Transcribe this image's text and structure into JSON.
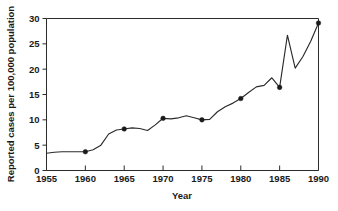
{
  "chart_data": {
    "type": "line",
    "title": "",
    "xlabel": "Year",
    "ylabel": "Reported cases per 100,000 population",
    "xlim": [
      1955,
      1990
    ],
    "ylim": [
      0,
      30
    ],
    "xticks": [
      1955,
      1960,
      1965,
      1970,
      1975,
      1980,
      1985,
      1990
    ],
    "xtick_labels": [
      "1955",
      "1960",
      "1965",
      "1970",
      "1975",
      "1980",
      "1985",
      "1990"
    ],
    "yticks": [
      0,
      5,
      10,
      15,
      20,
      25,
      30
    ],
    "ytick_labels": [
      "0",
      "5",
      "10",
      "15",
      "20",
      "25",
      "30"
    ],
    "grid": false,
    "legend": false,
    "legend_position": "none",
    "marker_style": "filled-circle",
    "marker_years": [
      1960,
      1965,
      1970,
      1975,
      1980,
      1985,
      1990
    ],
    "x": [
      1955,
      1956,
      1957,
      1958,
      1959,
      1960,
      1961,
      1962,
      1963,
      1964,
      1965,
      1966,
      1967,
      1968,
      1969,
      1970,
      1971,
      1972,
      1973,
      1974,
      1975,
      1976,
      1977,
      1978,
      1979,
      1980,
      1981,
      1982,
      1983,
      1984,
      1985,
      1986,
      1987,
      1988,
      1989,
      1990
    ],
    "values": [
      3.4,
      3.6,
      3.7,
      3.7,
      3.7,
      3.7,
      4.1,
      5.0,
      7.2,
      8.0,
      8.2,
      8.4,
      8.3,
      7.9,
      9.0,
      10.3,
      10.2,
      10.4,
      10.8,
      10.4,
      10.0,
      10.1,
      11.6,
      12.6,
      13.3,
      14.2,
      15.4,
      16.5,
      16.8,
      18.3,
      16.4,
      26.7,
      20.2,
      22.5,
      25.5,
      29.1
    ],
    "series": [
      {
        "name": "Reported cases per 100,000 population",
        "values": [
          3.4,
          3.6,
          3.7,
          3.7,
          3.7,
          3.7,
          4.1,
          5.0,
          7.2,
          8.0,
          8.2,
          8.4,
          8.3,
          7.9,
          9.0,
          10.3,
          10.2,
          10.4,
          10.8,
          10.4,
          10.0,
          10.1,
          11.6,
          12.6,
          13.3,
          14.2,
          15.4,
          16.5,
          16.8,
          18.3,
          16.4,
          26.7,
          20.2,
          22.5,
          25.5,
          29.1
        ]
      }
    ],
    "annotations": [],
    "colors": {
      "line": "#2b2b2b",
      "marker": "#1a1a1a",
      "axis": "#2b2b2b",
      "text": "#1a1a1a",
      "background": "#ffffff"
    }
  }
}
